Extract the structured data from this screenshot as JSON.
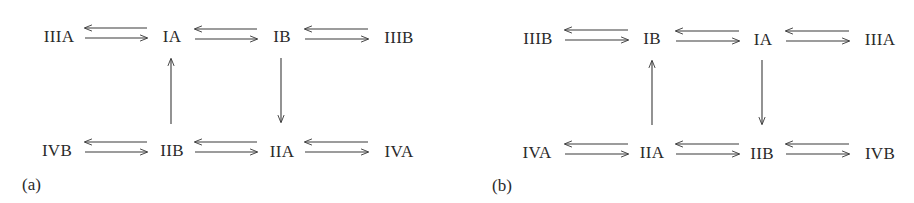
{
  "panels": [
    {
      "label": "(a)",
      "top_row": [
        "IIIA",
        "IA",
        "IB",
        "IIIB"
      ],
      "bottom_row": [
        "IVB",
        "IIB",
        "IIA",
        "IVA"
      ],
      "vertical_arrows": [
        {
          "from": "IIB",
          "to": "IA",
          "direction": "up"
        },
        {
          "from": "IB",
          "to": "IIA",
          "direction": "down"
        }
      ],
      "equilibria": "reversible (double harpoon arrows) between adjacent horizontal states"
    },
    {
      "label": "(b)",
      "top_row": [
        "IIIB",
        "IB",
        "IA",
        "IIIA"
      ],
      "bottom_row": [
        "IVA",
        "IIA",
        "IIB",
        "IVB"
      ],
      "vertical_arrows": [
        {
          "from": "IIA",
          "to": "IB",
          "direction": "up"
        },
        {
          "from": "IA",
          "to": "IIB",
          "direction": "down"
        }
      ],
      "equilibria": "reversible (double harpoon arrows) between adjacent horizontal states"
    }
  ],
  "colors": {
    "ink": "#2a2a2a",
    "background": "#ffffff"
  }
}
